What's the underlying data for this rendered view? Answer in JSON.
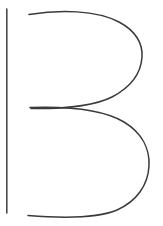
{
  "canvas": {
    "width": 163,
    "height": 226,
    "background_color": "#ffffff",
    "description": "Line-art drawing of the capital letter B"
  },
  "artwork": {
    "title": "Letter B outline",
    "glyph": "B",
    "style": "thin single-stroke outline, hand-drawn / calligraphic construction",
    "stroke_color": "#3a3a3a",
    "stroke_color_dark": "#2b2b2b",
    "stroke_width": 1.5,
    "strokes": [
      {
        "name": "vertical-stem",
        "label": "Vertical stem",
        "color": "#4a4a4a",
        "width": 1.6,
        "path": "M 6.8 9 L 6.8 213"
      },
      {
        "name": "upper-bowl",
        "label": "Upper bowl",
        "color": "#3a3a3a",
        "width": 1.5,
        "path": "M 29 14.5 C 60 9.5, 96 10, 119 22 C 136 31, 143 44, 142 57 C 141 73, 131 87, 112 97 C 95 105.5, 70 109, 31 108.5"
      },
      {
        "name": "lower-bowl",
        "label": "Lower bowl",
        "color": "#3a3a3a",
        "width": 1.5,
        "path": "M 30 107.5 C 74 106, 104 110, 124 122 C 142 133, 150 149, 149 166 C 148 185, 137 201, 117 210 C 98 218, 66 218.5, 28 215.5"
      }
    ]
  }
}
